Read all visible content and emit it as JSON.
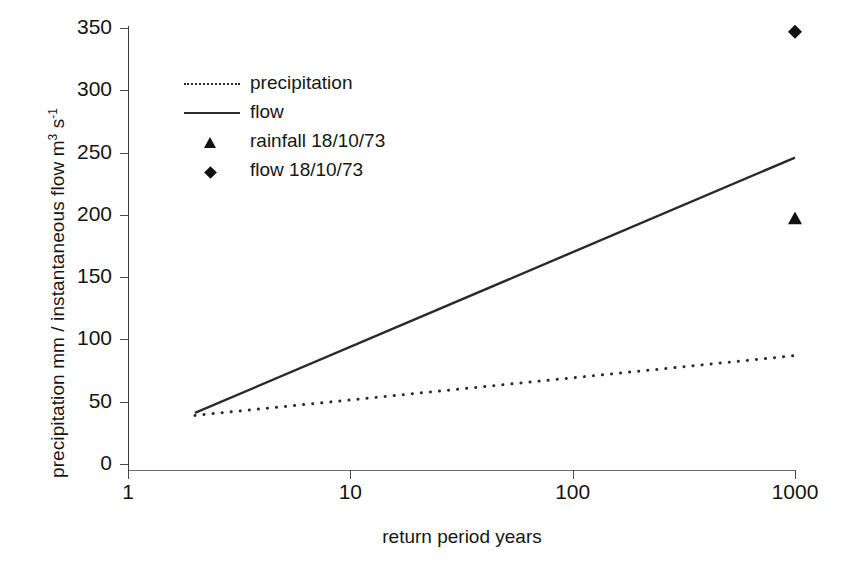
{
  "chart_data": {
    "type": "line",
    "title": "",
    "xlabel": "return period  years",
    "ylabel": "precipitation  mm / instantaneous flow  m3 s-1",
    "ylabel_parts": {
      "text_before": "precipitation  mm / instantaneous flow  m",
      "sup1": "3",
      "text_mid": "s",
      "sup2": "-1"
    },
    "xscale": "log",
    "yscale": "linear",
    "xlim": [
      1,
      1000
    ],
    "ylim": [
      0,
      350
    ],
    "grid": false,
    "legend_position": "upper-left-inside",
    "x_ticks": [
      "1",
      "10",
      "100",
      "1000"
    ],
    "x_tick_values": [
      1,
      10,
      100,
      1000
    ],
    "y_ticks": [
      "0",
      "50",
      "100",
      "150",
      "200",
      "250",
      "300",
      "350"
    ],
    "y_tick_values": [
      0,
      50,
      100,
      150,
      200,
      250,
      300,
      350
    ],
    "series": [
      {
        "name": "precipitation",
        "style": "dotted",
        "color": "#2a2a2a",
        "x": [
          2,
          1000
        ],
        "values": [
          39,
          87
        ]
      },
      {
        "name": "flow",
        "style": "solid",
        "color": "#2a2a2a",
        "x": [
          2,
          1000
        ],
        "values": [
          41,
          246
        ]
      },
      {
        "name": "rainfall 18/10/73",
        "style": "marker-triangle",
        "color": "#111111",
        "x": [
          1000
        ],
        "values": [
          197
        ]
      },
      {
        "name": "flow  18/10/73",
        "style": "marker-diamond",
        "color": "#111111",
        "x": [
          1000
        ],
        "values": [
          347
        ]
      }
    ],
    "legend": [
      {
        "label": "precipitation",
        "marker": "dotted-line"
      },
      {
        "label": "flow",
        "marker": "solid-line"
      },
      {
        "label": "rainfall 18/10/73",
        "marker": "triangle"
      },
      {
        "label": "flow  18/10/73",
        "marker": "diamond"
      }
    ]
  }
}
